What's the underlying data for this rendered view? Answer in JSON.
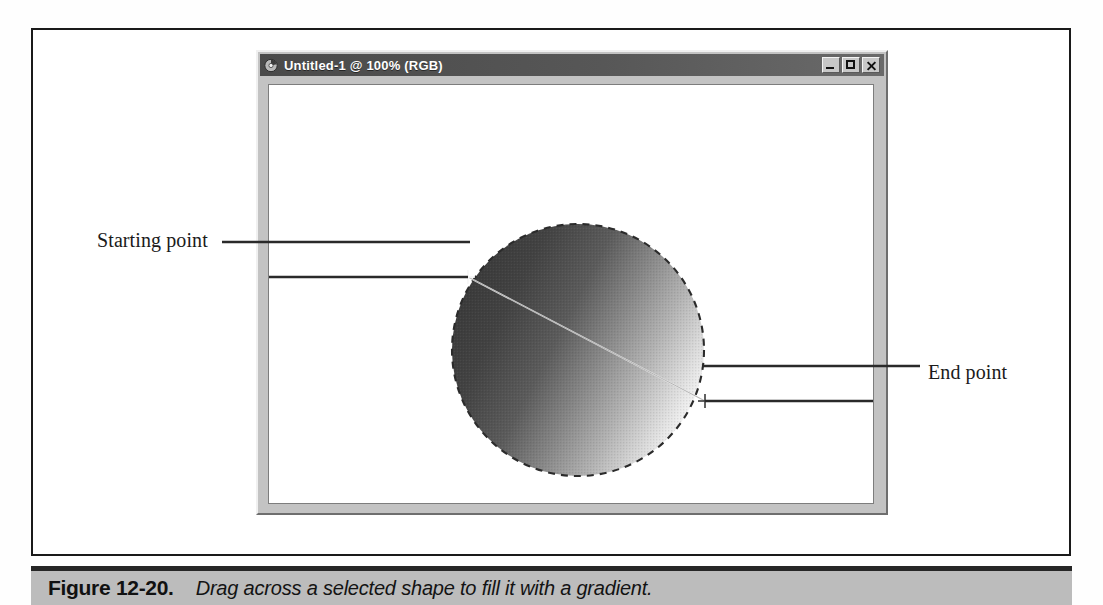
{
  "figure": {
    "number_label": "Figure 12-20.",
    "caption": "Drag across a selected shape to fill it with a gradient."
  },
  "window": {
    "title": "Untitled-1 @ 100% (RGB)",
    "title_icon": "document-icon",
    "controls": {
      "minimize": "_",
      "maximize": "□",
      "close": "×"
    }
  },
  "annotations": {
    "start_label": "Starting point",
    "end_label": "End point"
  },
  "artwork": {
    "shape": "circle",
    "selection_style": "marching-ants-dashed",
    "fill": "linear-gradient",
    "gradient_from": "#3a3a3a",
    "gradient_to": "#ffffff",
    "drag_line": "start-to-end"
  },
  "colors": {
    "titlebar": "#575757",
    "window_face": "#c3c3c3",
    "caption_bar": "#bcbcbc",
    "canvas": "#ffffff",
    "rule": "#1a1a1a"
  }
}
